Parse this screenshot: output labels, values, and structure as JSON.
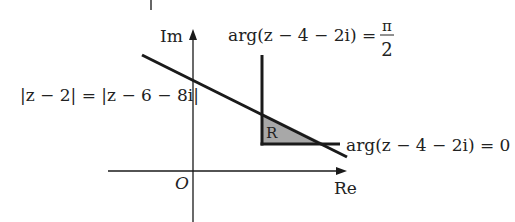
{
  "diagram": {
    "type": "argand-diagram-region",
    "axes": {
      "real_label": "Re",
      "imag_label": "Im",
      "origin_label": "O"
    },
    "loci": [
      {
        "id": "perp-bisector",
        "label": "|z − 2| = |z − 6 − 8i|"
      },
      {
        "id": "half-line-vertical",
        "label_main": "arg(z − 4 − 2i) =",
        "label_frac_num": "π",
        "label_frac_den": "2"
      },
      {
        "id": "half-line-horizontal",
        "label": "arg(z − 4 − 2i) = 0"
      }
    ],
    "region": {
      "label": "R",
      "fill": "#a8a8a8"
    },
    "colors": {
      "line": "#1a1a1a",
      "text": "#222222",
      "background": "#ffffff"
    }
  }
}
